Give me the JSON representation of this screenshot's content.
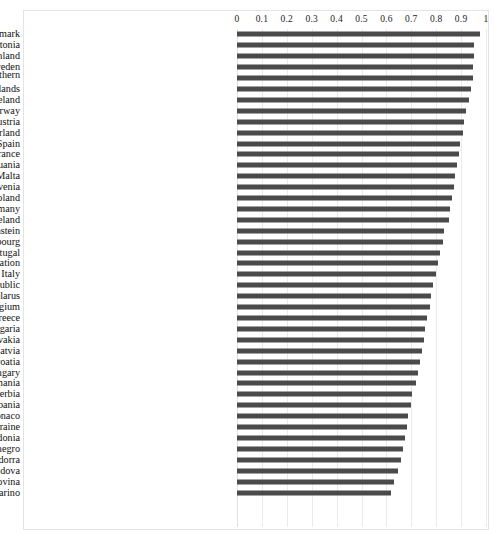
{
  "chart": {
    "type": "bar",
    "orientation": "horizontal",
    "bar_color": "#4a4a4a",
    "grid_color": "#ebebeb",
    "border_color": "#e4e4e4"
  },
  "chart_data": {
    "type": "bar",
    "title": "",
    "xlabel": "",
    "ylabel": "",
    "xlim": [
      0,
      1
    ],
    "grid": true,
    "legend": false,
    "tick_labels": [
      "0",
      "0.1",
      "0.2",
      "0.3",
      "0.4",
      "0.5",
      "0.6",
      "0.7",
      "0.8",
      "0.9",
      "1"
    ],
    "ticks": [
      0,
      0.1,
      0.2,
      0.3,
      0.4,
      0.5,
      0.6,
      0.7,
      0.8,
      0.9,
      1
    ],
    "categories": [
      "Denmark",
      "Estonia",
      "Finland",
      "Sweden",
      "United Kingdom of Great Britain and Northern Ireland",
      "Netherlands",
      "Iceland",
      "Norway",
      "Austria",
      "Switzerland",
      "Spain",
      "France",
      "Lithuania",
      "Malta",
      "Slovenia",
      "Poland",
      "Germany",
      "Ireland",
      "Liechtenstein",
      "Luxembourg",
      "Portugal",
      "Russian Federation",
      "Italy",
      "Czech Republic",
      "Belarus",
      "Belgium",
      "Greece",
      "Bulgaria",
      "Slovakia",
      "Latvia",
      "Croatia",
      "Hungary",
      "Romania",
      "Serbia",
      "Albania",
      "Monaco",
      "Ukraine",
      "North Macedonia",
      "Montenegro",
      "Andorra",
      "Republic of Moldova",
      "Bosnia and Herzegovina",
      "San Marino"
    ],
    "values": [
      0.975,
      0.952,
      0.951,
      0.949,
      0.947,
      0.941,
      0.932,
      0.921,
      0.913,
      0.907,
      0.897,
      0.891,
      0.884,
      0.877,
      0.871,
      0.864,
      0.857,
      0.851,
      0.833,
      0.829,
      0.814,
      0.806,
      0.799,
      0.789,
      0.781,
      0.775,
      0.763,
      0.755,
      0.749,
      0.742,
      0.734,
      0.726,
      0.717,
      0.704,
      0.699,
      0.688,
      0.681,
      0.673,
      0.665,
      0.659,
      0.646,
      0.632,
      0.617
    ]
  }
}
